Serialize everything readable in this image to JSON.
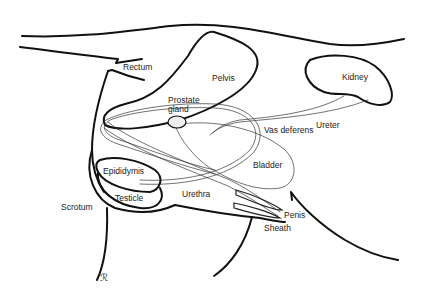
{
  "diagram": {
    "type": "anatomical-line-drawing",
    "colors": {
      "line": "#111111",
      "background": "#ffffff",
      "text": "#222222"
    },
    "labels": {
      "rectum": "Rectum",
      "pelvis": "Pelvis",
      "kidney": "Kidney",
      "prostate_line1": "Prostate",
      "prostate_line2": "gland",
      "vas_deferens": "Vas deferens",
      "ureter": "Ureter",
      "bladder": "Bladder",
      "epididymis": "Epididymis",
      "testicle": "Testicle",
      "urethra": "Urethra",
      "scrotum": "Scrotum",
      "penis": "Penis",
      "sheath": "Sheath",
      "signature": "ℛ"
    }
  }
}
